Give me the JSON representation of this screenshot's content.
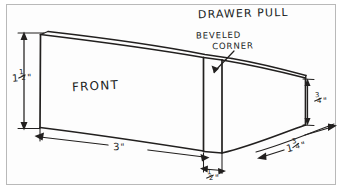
{
  "drawing": {
    "title": "DRAWER PULL",
    "face_label": "FRONT",
    "callout": {
      "name": "beveled-corner-callout",
      "line_1": "BEVELED",
      "line_2": "CORNER"
    },
    "dimensions": [
      {
        "name": "height",
        "label": "1 1/2\"",
        "whole": "1",
        "numerator": "1",
        "denominator": "2",
        "unit": "\"",
        "value_inches": 1.5,
        "position": "left-vertical"
      },
      {
        "name": "front-width",
        "label": "3\"",
        "whole": "3",
        "numerator": "",
        "denominator": "",
        "unit": "\"",
        "value_inches": 3,
        "position": "bottom-horizontal"
      },
      {
        "name": "bevel-width",
        "label": "1/2\"",
        "whole": "",
        "numerator": "1",
        "denominator": "2",
        "unit": "\"",
        "value_inches": 0.5,
        "position": "bottom-center"
      },
      {
        "name": "end-height",
        "label": "3/4\"",
        "whole": "",
        "numerator": "3",
        "denominator": "4",
        "unit": "\"",
        "value_inches": 0.75,
        "position": "right-vertical"
      },
      {
        "name": "taper-length",
        "label": "1 3/4\"",
        "whole": "1",
        "numerator": "3",
        "denominator": "4",
        "unit": "\"",
        "value_inches": 1.75,
        "position": "bottom-right-diagonal"
      }
    ],
    "colors": {
      "ink": "#22201f",
      "paper": "#fdfdfd",
      "frame": "#b9b9b9",
      "page": "#ffffff"
    }
  }
}
